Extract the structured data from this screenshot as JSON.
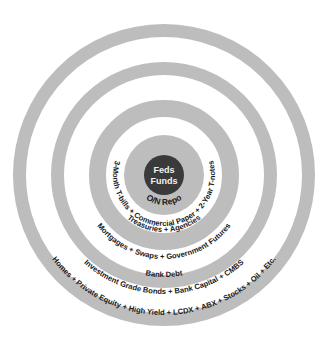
{
  "diagram": {
    "type": "concentric-circles",
    "colors": {
      "background": "#ffffff",
      "ring_fill": "#bdbdbd",
      "core_fill": "#3a3a3a",
      "core_text": "#f2f2f2",
      "label_text": "#1a1a1a"
    },
    "core": {
      "line1": "Feds",
      "line2": "Funds"
    },
    "layers": [
      {
        "id": "on-repo",
        "label": "O/N Repo"
      },
      {
        "id": "short-term",
        "label": "3-Month T-bills + Commercial Paper + 2-Year T-notes"
      },
      {
        "id": "treasuries",
        "label": "Treasuries + Agencies"
      },
      {
        "id": "mortgages",
        "label": "Mortgages + Swaps + Government Futures"
      },
      {
        "id": "bank-debt",
        "label": "Bank Debt"
      },
      {
        "id": "investment-grade",
        "label": "Investment Grade Bonds + Bank Capital + CMBS"
      },
      {
        "id": "risk-assets",
        "label": "Homes + Private Equity + High Yield + LCDX + ABX + Stocks + Oil + Etc."
      }
    ]
  }
}
